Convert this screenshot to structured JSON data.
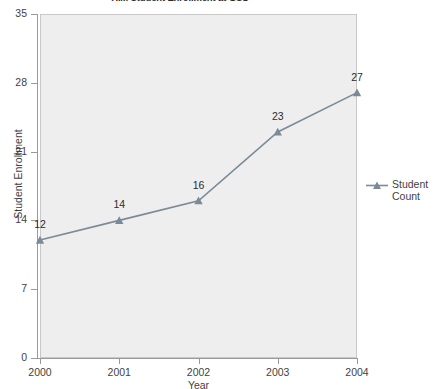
{
  "chart_data": {
    "type": "line",
    "title": "HIM Student Enrollment at GSU",
    "xlabel": "Year",
    "ylabel": "Student Enrollment",
    "categories": [
      "2000",
      "2001",
      "2002",
      "2003",
      "2004"
    ],
    "x": [
      2000,
      2001,
      2002,
      2003,
      2004
    ],
    "values": [
      12,
      14,
      16,
      23,
      27
    ],
    "point_labels": [
      "12",
      "14",
      "16",
      "23",
      "27"
    ],
    "series": [
      {
        "name": "Student Count",
        "values": [
          12,
          14,
          16,
          23,
          27
        ],
        "color": "#7b8a96",
        "marker": "triangle"
      }
    ],
    "ylim": [
      0,
      35
    ],
    "yticks": [
      0,
      7,
      14,
      21,
      28,
      35
    ],
    "ytick_labels": [
      "0",
      "7",
      "14",
      "21",
      "28",
      "35"
    ],
    "xlim": [
      2000,
      2004
    ],
    "xticks": [
      2000,
      2001,
      2002,
      2003,
      2004
    ],
    "xtick_labels": [
      "2000",
      "2001",
      "2002",
      "2003",
      "2004"
    ],
    "grid": false,
    "legend_position": "right",
    "plot_background": "#eeeeee",
    "axis_color": "#9a9a9a",
    "text_color": "#3f3f3f"
  },
  "legend": {
    "entries": [
      {
        "label_line1": "Student",
        "label_line2": "Count",
        "color": "#7b8a96"
      }
    ]
  }
}
